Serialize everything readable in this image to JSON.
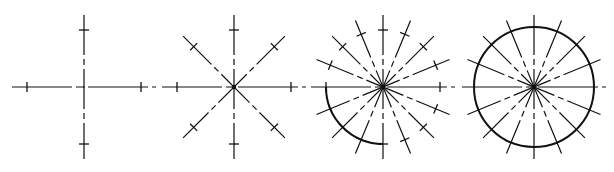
{
  "diagram": {
    "title": "",
    "colors": {
      "ink": "#111111",
      "background": "#ffffff"
    },
    "steps": [
      {
        "id": "step-1",
        "center": [
          84,
          87
        ],
        "line_length": 72,
        "tick_radius": 57,
        "lines": 2,
        "ticked": true,
        "arc": "none"
      },
      {
        "id": "step-2",
        "center": [
          234,
          87
        ],
        "line_length": 72,
        "tick_radius": 57,
        "lines": 4,
        "ticked": true,
        "arc": "none"
      },
      {
        "id": "step-3",
        "center": [
          383,
          87
        ],
        "line_length": 72,
        "tick_radius": 57,
        "lines": 8,
        "ticked": true,
        "arc": "quarter-lower-left"
      },
      {
        "id": "step-4",
        "center": [
          534,
          87
        ],
        "line_length": 72,
        "tick_radius": 60,
        "lines": 8,
        "ticked": false,
        "arc": "full"
      }
    ]
  }
}
